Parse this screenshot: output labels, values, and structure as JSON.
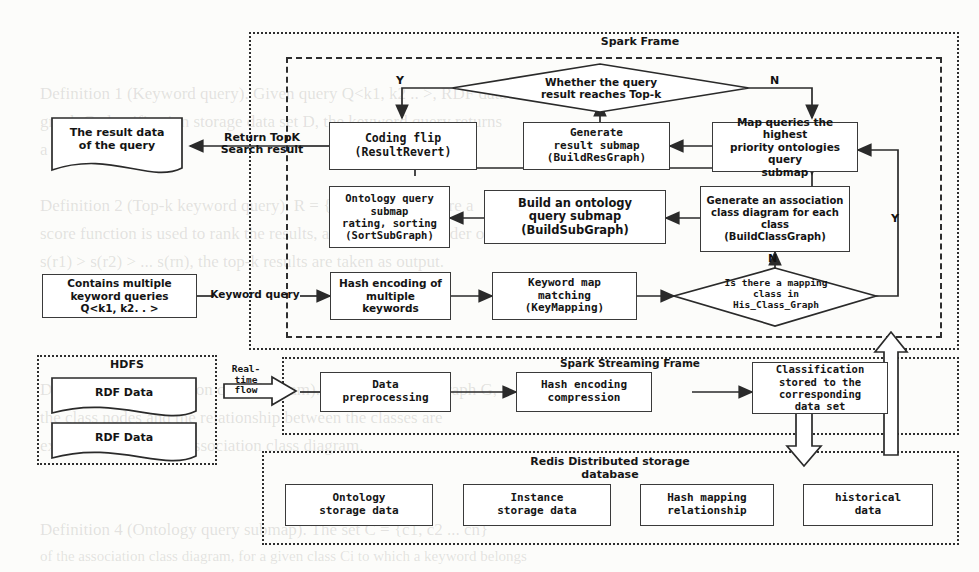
{
  "frames": [
    {
      "id": "spark",
      "label": "Spark Frame"
    },
    {
      "id": "spark_inner",
      "label": ""
    },
    {
      "id": "hdfs",
      "label": "HDFS"
    },
    {
      "id": "streaming",
      "label": "Spark Streaming Frame"
    },
    {
      "id": "redis",
      "label": "Redis Distributed storage\ndatabase"
    }
  ],
  "nodes": {
    "result_doc": "The result data\nof the query",
    "query_input": "Contains multiple\nkeyword queries\nQ<k1, k2. . >",
    "coding_flip": "Coding flip\n(ResultRevert)",
    "gen_result_submap": "Generate\nresult submap\n(BuildResGraph)",
    "map_queries": "Map queries the highest\npriority ontologies query\nsubmap",
    "ontology_rating": "Ontology query\nsubmap\nrating, sorting\n(SortSubGraph)",
    "build_submap": "Build an ontology\nquery submap\n(BuildSubGraph)",
    "gen_class_diagram": "Generate an association\nclass diagram for each\nclass\n(BuildClassGraph)",
    "hash_encoding": "Hash encoding of\nmultiple\nkeywords",
    "keyword_map": "Keyword map\nmatching\n(KeyMapping)",
    "rdf_data_1": "RDF Data",
    "rdf_data_2": "RDF Data",
    "data_preprocessing": "Data\npreprocessing",
    "hash_compression": "Hash encoding\ncompression",
    "classification_store": "Classification\nstored to the\ncorresponding\ndata set",
    "redis_ontology": "Ontology\nstorage data",
    "redis_instance": "Instance\nstorage data",
    "redis_hashmap": "Hash mapping\nrelationship",
    "redis_history": "historical\ndata"
  },
  "decisions": {
    "topk": "Whether the query\nresult reaches Top-k",
    "mapping_class": "Is there a mapping\nclass in\nHis_Class_Graph"
  },
  "edge_labels": {
    "return_topk": "Return TopK\nSearch result",
    "keyword_query": "Keyword query",
    "realtime_flow": "Real-\ntime\nflow"
  },
  "branch_labels": {
    "topk_yes": "Y",
    "topk_no": "N",
    "mapping_no": "N",
    "mapping_yes": "Y"
  },
  "ghost_text": [
    {
      "t": "Definition 1 (Keyword query). Given query Q<k1, k2 .. >, RDF data",
      "x": 40,
      "y": 84,
      "size": 17
    },
    {
      "t": "graph G classification storage data set D, the keyword query returns",
      "x": 40,
      "y": 112,
      "size": 17
    },
    {
      "t": "a result set R.",
      "x": 40,
      "y": 140,
      "size": 17
    },
    {
      "t": "Definition 2 (Top-k keyword query). R = {r1, r2 ... rn}, where a",
      "x": 40,
      "y": 196,
      "size": 17
    },
    {
      "t": "score function is used to rank the results, according to the order of",
      "x": 40,
      "y": 224,
      "size": 17
    },
    {
      "t": "s(r1) > s(r2) > ... s(rn), the top-k results are taken as output.",
      "x": 40,
      "y": 252,
      "size": 17
    },
    {
      "t": "Definition 3 (Association class diagram). In the RDF data graph G,",
      "x": 40,
      "y": 380,
      "size": 17
    },
    {
      "t": "the class nodes and the relationship between the classes are",
      "x": 40,
      "y": 408,
      "size": 17
    },
    {
      "t": "extracted to form the association class diagram.",
      "x": 40,
      "y": 436,
      "size": 17
    },
    {
      "t": "Definition 4 (Ontology query submap). The set C = {c1, c2 ... cn}",
      "x": 40,
      "y": 520,
      "size": 17
    },
    {
      "t": "of the association class diagram, for a given class Ci to which a keyword belongs",
      "x": 40,
      "y": 548,
      "size": 15
    }
  ]
}
